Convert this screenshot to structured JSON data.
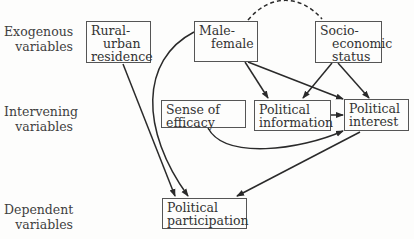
{
  "rows": {
    "exogenous": [
      "Exogenous",
      "variables"
    ],
    "intervening": [
      "Intervening",
      "variables"
    ],
    "dependent": [
      "Dependent",
      "variables"
    ]
  },
  "nodes": {
    "rural_urban": [
      "Rural-",
      "urban",
      "residence"
    ],
    "male_female": [
      "Male-",
      "female"
    ],
    "socioeconomic": [
      "Socio-",
      "economic",
      "status"
    ],
    "efficacy": [
      "Sense of",
      "efficacy"
    ],
    "information": [
      "Political",
      "information"
    ],
    "interest": [
      "Political",
      "interest"
    ],
    "participation": [
      "Political",
      "participation"
    ]
  },
  "edges": [
    {
      "from": "male_female",
      "to": "socioeconomic",
      "style": "dashed-correlation"
    },
    {
      "from": "rural_urban",
      "to": "participation"
    },
    {
      "from": "male_female",
      "to": "participation"
    },
    {
      "from": "male_female",
      "to": "information"
    },
    {
      "from": "male_female",
      "to": "interest"
    },
    {
      "from": "socioeconomic",
      "to": "information"
    },
    {
      "from": "socioeconomic",
      "to": "interest"
    },
    {
      "from": "information",
      "to": "interest"
    },
    {
      "from": "efficacy",
      "to": "interest"
    },
    {
      "from": "interest",
      "to": "participation"
    }
  ]
}
